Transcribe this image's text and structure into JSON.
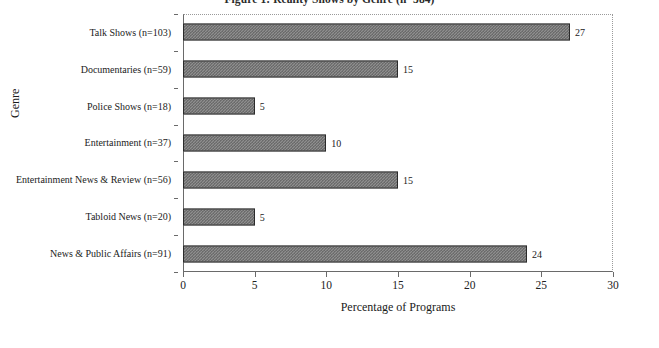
{
  "chart_data": {
    "type": "bar",
    "orientation": "horizontal",
    "title": "Figure 1: Reality Shows by Genre (n=384)",
    "xlabel": "Percentage of Programs",
    "ylabel": "Genre",
    "xlim": [
      0,
      30
    ],
    "xticks": [
      0,
      5,
      10,
      15,
      20,
      25,
      30
    ],
    "grid": false,
    "legend": "none",
    "categories": [
      "Talk Shows (n=103)",
      "Documentaries (n=59)",
      "Police Shows (n=18)",
      "Entertainment (n=37)",
      "Entertainment News & Review (n=56)",
      "Tabloid News (n=20)",
      "News & Public Affairs (n=91)"
    ],
    "values": [
      27,
      15,
      5,
      10,
      15,
      5,
      24
    ],
    "data_labels": [
      "27",
      "15",
      "5",
      "10",
      "15",
      "5",
      "24"
    ],
    "bar_fill": "#8f8f8f",
    "bar_pattern": "checkered-hatch",
    "bar_border": "#2a2a2a",
    "background": "#ffffff"
  }
}
